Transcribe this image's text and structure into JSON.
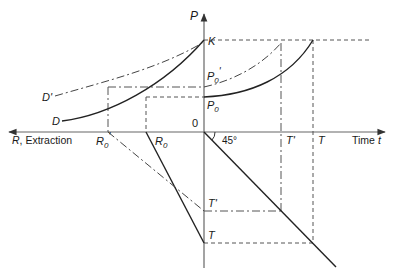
{
  "diagram": {
    "type": "four-quadrant resource extraction diagram",
    "axes": {
      "vertical_label": "P",
      "horizontal_right_label": "Time t",
      "horizontal_right_word": "Time ",
      "horizontal_right_var": "t",
      "horizontal_left_label": "R, Extraction",
      "horizontal_left_var": "R",
      "horizontal_left_word": ", Extraction",
      "origin_label": "0"
    },
    "price_axis_labels": {
      "K": "K",
      "P0_prime_main": "P",
      "P0_prime_sub": "0",
      "P0_prime_mark": "'",
      "P0_main": "P",
      "P0_sub": "0"
    },
    "demand_labels": {
      "D": "D",
      "D_prime": "D'"
    },
    "extraction_labels": {
      "R0_prime_main": "R",
      "R0_prime_sub": "0",
      "R0_prime_mark": "'",
      "R0_main": "R",
      "R0_sub": "0"
    },
    "time_labels": {
      "T_prime_axis": "T'",
      "T_axis": "T",
      "T_prime_lower": "T'",
      "T_lower": "T"
    },
    "angle_label": "45°",
    "colors": {
      "line": "#2a2a2a",
      "axis": "#555555",
      "background": "#ffffff"
    }
  }
}
